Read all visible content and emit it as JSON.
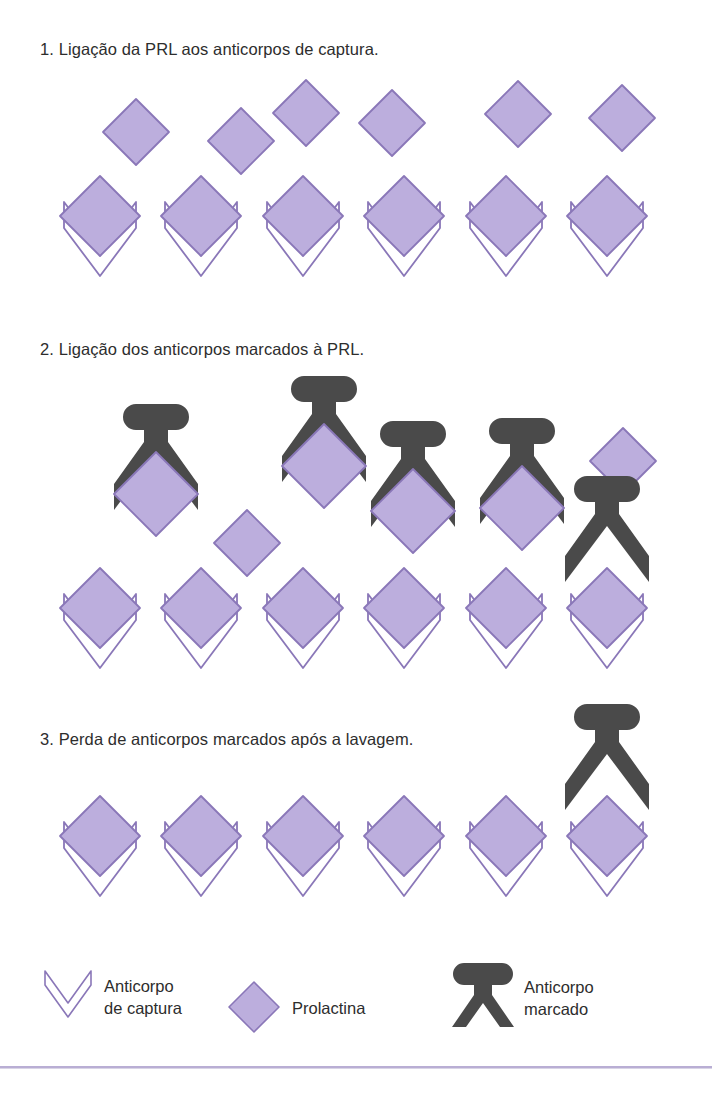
{
  "document": {
    "language": "pt",
    "background_color": "#ffffff"
  },
  "colors": {
    "prolactin_fill": "#bcaedd",
    "prolactin_stroke": "#8a77b8",
    "capture_antibody_fill": "#ffffff",
    "capture_antibody_stroke": "#8a77b8",
    "labeled_antibody_fill": "#4a4a4a",
    "text": "#2d2d2d",
    "rule": "#b9aed4"
  },
  "panels": [
    {
      "id": "panel-1",
      "number": "1.",
      "caption": "1. Ligação da PRL aos anticorpos de captura.",
      "caption_text": "Ligação da PRL aos anticorpos de captura.",
      "bound_complexes": 6,
      "free_prolactin": 6,
      "labeled_antibodies": 0,
      "items": [
        {
          "type": "prolactin-free",
          "x": 136,
          "y": 132
        },
        {
          "type": "prolactin-free",
          "x": 241,
          "y": 141
        },
        {
          "type": "prolactin-free",
          "x": 306,
          "y": 113
        },
        {
          "type": "prolactin-free",
          "x": 392,
          "y": 123
        },
        {
          "type": "prolactin-free",
          "x": 518,
          "y": 114
        },
        {
          "type": "prolactin-free",
          "x": 622,
          "y": 118
        },
        {
          "type": "capture-bound",
          "x": 100,
          "y": 232
        },
        {
          "type": "capture-bound",
          "x": 201,
          "y": 232
        },
        {
          "type": "capture-bound",
          "x": 303,
          "y": 232
        },
        {
          "type": "capture-bound",
          "x": 404,
          "y": 232
        },
        {
          "type": "capture-bound",
          "x": 506,
          "y": 232
        },
        {
          "type": "capture-bound",
          "x": 607,
          "y": 232
        }
      ]
    },
    {
      "id": "panel-2",
      "number": "2.",
      "caption": "2. Ligação dos anticorpos marcados à PRL.",
      "caption_text": "Ligação dos anticorpos marcados à PRL.",
      "bound_complexes": 6,
      "free_prolactin": 2,
      "labeled_antibodies": 5,
      "items": [
        {
          "type": "labeled-on-prolactin",
          "x": 156,
          "y": 492
        },
        {
          "type": "prolactin-free",
          "x": 247,
          "y": 543
        },
        {
          "type": "labeled-on-prolactin",
          "x": 324,
          "y": 464
        },
        {
          "type": "labeled-on-prolactin",
          "x": 413,
          "y": 509
        },
        {
          "type": "labeled-on-prolactin",
          "x": 522,
          "y": 506
        },
        {
          "type": "prolactin-free",
          "x": 623,
          "y": 461
        },
        {
          "type": "capture-bound",
          "x": 100,
          "y": 624
        },
        {
          "type": "capture-bound",
          "x": 201,
          "y": 624
        },
        {
          "type": "capture-bound",
          "x": 303,
          "y": 624
        },
        {
          "type": "capture-bound",
          "x": 404,
          "y": 624
        },
        {
          "type": "capture-bound",
          "x": 506,
          "y": 624
        },
        {
          "type": "labeled-capture-bound",
          "x": 607,
          "y": 624
        }
      ]
    },
    {
      "id": "panel-3",
      "number": "3.",
      "caption": "3. Perda de anticorpos marcados após a lavagem.",
      "caption_text": "Perda de anticorpos marcados após a lavagem.",
      "bound_complexes": 6,
      "free_prolactin": 0,
      "labeled_antibodies": 1,
      "items": [
        {
          "type": "capture-bound",
          "x": 100,
          "y": 852
        },
        {
          "type": "capture-bound",
          "x": 201,
          "y": 852
        },
        {
          "type": "capture-bound",
          "x": 303,
          "y": 852
        },
        {
          "type": "capture-bound",
          "x": 404,
          "y": 852
        },
        {
          "type": "capture-bound",
          "x": 506,
          "y": 852
        },
        {
          "type": "labeled-capture-bound",
          "x": 607,
          "y": 852
        }
      ]
    }
  ],
  "legend": {
    "items": [
      {
        "id": "legend-capture-antibody",
        "icon": "capture-antibody-icon",
        "line1": "Anticorpo",
        "line2": "de captura"
      },
      {
        "id": "legend-prolactin",
        "icon": "prolactin-diamond-icon",
        "line1": "Prolactina",
        "line2": ""
      },
      {
        "id": "legend-labeled-antibody",
        "icon": "labeled-antibody-icon",
        "line1": "Anticorpo",
        "line2": "marcado"
      }
    ]
  }
}
